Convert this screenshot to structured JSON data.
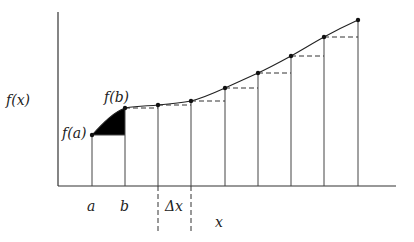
{
  "diagram": {
    "title": "",
    "labels": {
      "y_axis": "f(x)",
      "x_axis": "x",
      "fa": "f(a)",
      "fb": "f(b)",
      "a": "a",
      "b": "b",
      "delta_x": "Δx"
    },
    "axes": {
      "origin": [
        58,
        186
      ],
      "y_top": 12,
      "x_right": 396
    },
    "partition_x": [
      92,
      125,
      158,
      191,
      225,
      258,
      291,
      324,
      358
    ],
    "curve_points": [
      [
        92,
        135
      ],
      [
        125,
        108
      ],
      [
        158,
        105
      ],
      [
        191,
        101
      ],
      [
        225,
        88
      ],
      [
        258,
        73
      ],
      [
        291,
        56
      ],
      [
        324,
        37
      ],
      [
        358,
        20
      ]
    ],
    "shaded_region": "area between f(a) and curve over [a,b], above lower rectangle height f(a)",
    "colors": {
      "ink": "#222222",
      "fill": "#000000",
      "background": "#ffffff"
    }
  }
}
